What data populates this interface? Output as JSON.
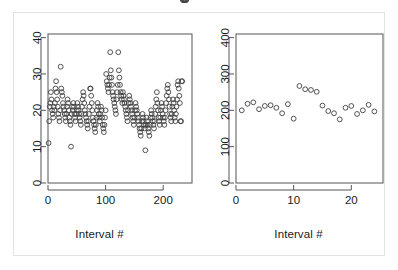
{
  "figure": {
    "background": "#ffffff",
    "border_color": "#e2e2e2",
    "axis_color": "#555555",
    "point_color": "#404040",
    "point_symbol": "open-circle"
  },
  "chart_data": [
    {
      "type": "scatter",
      "panel": "left",
      "title": "",
      "xlabel": "Interval #",
      "ylabel": "",
      "xlim": [
        0,
        250
      ],
      "ylim": [
        0,
        41
      ],
      "xticks": [
        0,
        100,
        200
      ],
      "yticks": [
        0,
        10,
        20,
        30,
        40
      ],
      "grid": false,
      "legend": "none",
      "x": [
        1,
        2,
        3,
        4,
        5,
        6,
        7,
        8,
        9,
        10,
        11,
        12,
        13,
        14,
        15,
        16,
        17,
        18,
        19,
        20,
        21,
        22,
        23,
        24,
        25,
        26,
        27,
        28,
        29,
        30,
        31,
        32,
        33,
        34,
        35,
        36,
        37,
        38,
        39,
        40,
        41,
        42,
        43,
        44,
        45,
        46,
        47,
        48,
        49,
        50,
        51,
        52,
        53,
        54,
        55,
        56,
        57,
        58,
        59,
        60,
        61,
        62,
        63,
        64,
        65,
        66,
        67,
        68,
        69,
        70,
        71,
        72,
        73,
        74,
        75,
        76,
        77,
        78,
        79,
        80,
        81,
        82,
        83,
        84,
        85,
        86,
        87,
        88,
        89,
        90,
        91,
        92,
        93,
        94,
        95,
        96,
        97,
        98,
        99,
        100,
        101,
        102,
        103,
        104,
        105,
        106,
        107,
        108,
        109,
        110,
        111,
        112,
        113,
        114,
        115,
        116,
        117,
        118,
        119,
        120,
        121,
        122,
        123,
        124,
        125,
        126,
        127,
        128,
        129,
        130,
        131,
        132,
        133,
        134,
        135,
        136,
        137,
        138,
        139,
        140,
        141,
        142,
        143,
        144,
        145,
        146,
        147,
        148,
        149,
        150,
        151,
        152,
        153,
        154,
        155,
        156,
        157,
        158,
        159,
        160,
        161,
        162,
        163,
        164,
        165,
        166,
        167,
        168,
        169,
        170,
        171,
        172,
        173,
        174,
        175,
        176,
        177,
        178,
        179,
        180,
        181,
        182,
        183,
        184,
        185,
        186,
        187,
        188,
        189,
        190,
        191,
        192,
        193,
        194,
        195,
        196,
        197,
        198,
        199,
        200,
        201,
        202,
        203,
        204,
        205,
        206,
        207,
        208,
        209,
        210,
        211,
        212,
        213,
        214,
        215,
        216,
        217,
        218,
        219,
        220,
        221,
        222,
        223,
        224,
        225,
        226,
        227,
        228,
        229,
        230,
        231,
        232,
        233,
        234,
        235,
        236,
        237,
        238,
        239,
        240
      ],
      "y": [
        11,
        17,
        21,
        22,
        25,
        23,
        20,
        19,
        18,
        21,
        20,
        22,
        26,
        28,
        25,
        23,
        21,
        19,
        18,
        17,
        20,
        32,
        26,
        25,
        24,
        22,
        21,
        20,
        19,
        18,
        17,
        19,
        21,
        23,
        22,
        20,
        18,
        17,
        16,
        10,
        19,
        21,
        20,
        22,
        21,
        19,
        18,
        17,
        19,
        20,
        22,
        21,
        20,
        19,
        18,
        17,
        16,
        19,
        21,
        23,
        25,
        24,
        22,
        20,
        19,
        18,
        17,
        16,
        15,
        17,
        19,
        21,
        26,
        26,
        24,
        22,
        20,
        18,
        17,
        16,
        15,
        14,
        16,
        18,
        20,
        22,
        21,
        19,
        18,
        17,
        19,
        21,
        20,
        18,
        16,
        15,
        14,
        16,
        18,
        20,
        30,
        28,
        27,
        26,
        25,
        27,
        29,
        36,
        31,
        29,
        27,
        25,
        24,
        23,
        22,
        21,
        20,
        19,
        23,
        25,
        27,
        36,
        31,
        29,
        27,
        25,
        24,
        23,
        22,
        25,
        24,
        23,
        22,
        21,
        20,
        19,
        18,
        17,
        20,
        22,
        24,
        23,
        22,
        21,
        20,
        19,
        18,
        17,
        16,
        18,
        20,
        22,
        21,
        20,
        19,
        18,
        17,
        16,
        15,
        14,
        13,
        15,
        17,
        19,
        18,
        17,
        16,
        15,
        9,
        16,
        18,
        17,
        16,
        15,
        14,
        13,
        16,
        18,
        20,
        19,
        18,
        17,
        16,
        15,
        17,
        19,
        21,
        23,
        25,
        22,
        20,
        18,
        17,
        16,
        18,
        20,
        22,
        21,
        19,
        18,
        17,
        16,
        18,
        20,
        22,
        24,
        26,
        27,
        25,
        23,
        21,
        19,
        18,
        17,
        19,
        21,
        23,
        22,
        20,
        18,
        17,
        19,
        21,
        23,
        27,
        28,
        26,
        24,
        22,
        17,
        17,
        28,
        28
      ]
    },
    {
      "type": "scatter",
      "panel": "right",
      "title": "",
      "xlabel": "Interval #",
      "ylabel": "",
      "xlim": [
        0,
        25.5
      ],
      "ylim": [
        0,
        410
      ],
      "xticks": [
        0,
        10,
        20
      ],
      "yticks": [
        0,
        100,
        200,
        300,
        400
      ],
      "grid": false,
      "legend": "none",
      "x": [
        1,
        2,
        3,
        4,
        5,
        6,
        7,
        8,
        9,
        10,
        11,
        12,
        13,
        14,
        15,
        16,
        17,
        18,
        19,
        20,
        21,
        22,
        23,
        24
      ],
      "y": [
        200,
        218,
        222,
        203,
        212,
        214,
        207,
        192,
        217,
        177,
        267,
        258,
        256,
        251,
        213,
        198,
        192,
        175,
        207,
        212,
        190,
        200,
        215,
        197
      ]
    }
  ],
  "panels": {
    "left": {
      "axis_title": "Interval #",
      "x_tick_labels": [
        "0",
        "100",
        "200"
      ],
      "y_tick_labels": [
        "0",
        "10",
        "20",
        "30",
        "40"
      ]
    },
    "right": {
      "axis_title": "Interval #",
      "x_tick_labels": [
        "0",
        "10",
        "20"
      ],
      "y_tick_labels": [
        "0",
        "100",
        "200",
        "300",
        "400"
      ]
    }
  }
}
